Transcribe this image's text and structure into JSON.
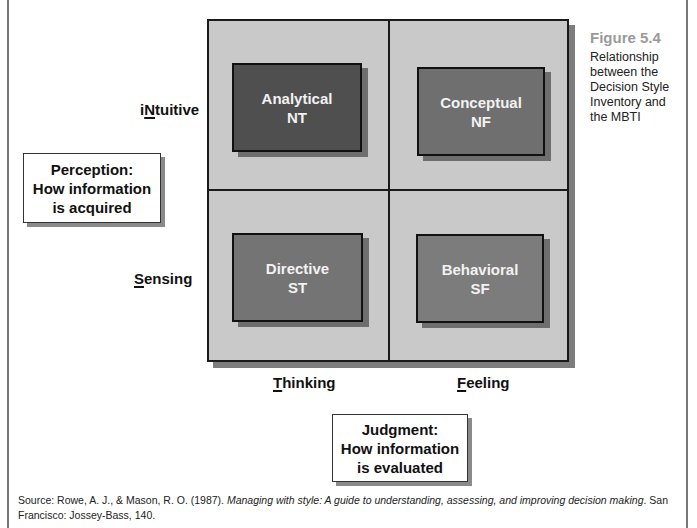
{
  "figure": {
    "number": "Figure 5.4",
    "caption": "Relationship between the Decision Style Inventory and the MBTI"
  },
  "quadrants": [
    {
      "id": "analytical",
      "name": "Analytical",
      "code": "NT",
      "color": "#4f4f4f"
    },
    {
      "id": "conceptual",
      "name": "Conceptual",
      "code": "NF",
      "color": "#6f6f6f"
    },
    {
      "id": "directive",
      "name": "Directive",
      "code": "ST",
      "color": "#747474"
    },
    {
      "id": "behavioral",
      "name": "Behavioral",
      "code": "SF",
      "color": "#7c7c7c"
    }
  ],
  "axes": {
    "intuitive": {
      "pre": "i",
      "key": "N",
      "post": "tuitive"
    },
    "sensing": {
      "pre": "",
      "key": "S",
      "post": "ensing"
    },
    "thinking": {
      "pre": "",
      "key": "T",
      "post": "hinking"
    },
    "feeling": {
      "pre": "",
      "key": "F",
      "post": "eeling"
    }
  },
  "perception": {
    "line1": "Perception:",
    "line2": "How information",
    "line3": "is acquired"
  },
  "judgment": {
    "line1": "Judgment:",
    "line2": "How information",
    "line3": "is evaluated"
  },
  "source": {
    "prefix": "Source: Rowe, A. J., & Mason, R. O. (1987). ",
    "title": "Managing with style: A guide to understanding, assessing, and improving decision making",
    "suffix": ". San Francisco: Jossey-Bass, 140."
  }
}
